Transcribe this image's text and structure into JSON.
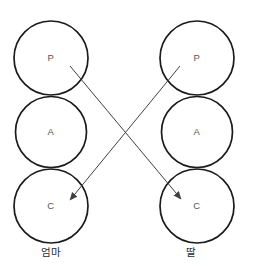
{
  "diagram": {
    "columns": {
      "left": {
        "label": "엄마",
        "circles": {
          "p": "P",
          "a": "A",
          "c": "C"
        }
      },
      "right": {
        "label": "딸",
        "circles": {
          "p": "P",
          "a": "A",
          "c": "C"
        }
      }
    },
    "arrows": [
      {
        "from": "left-P",
        "to": "right-C"
      },
      {
        "from": "right-P",
        "to": "left-C"
      }
    ],
    "colors": {
      "background": "#ffffff",
      "circle_stroke": "#1b1b1b",
      "arrow": "#3f3f3f",
      "letter": "#555555",
      "label": "#2b2b2b"
    }
  }
}
